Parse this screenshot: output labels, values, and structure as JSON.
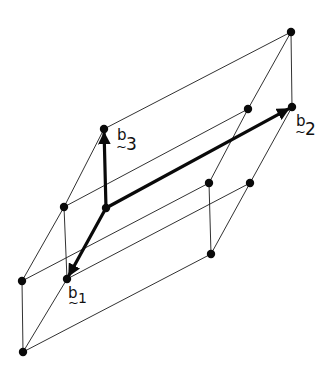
{
  "diagram": {
    "width": 336,
    "height": 367,
    "colors": {
      "line": "#1a1a1a",
      "vector": "#0a0a0a",
      "node": "#0a0a0a",
      "background": "#ffffff"
    },
    "nodes": [
      {
        "id": "O",
        "x": 106,
        "y": 208
      },
      {
        "id": "B1",
        "x": 67,
        "y": 279
      },
      {
        "id": "B2",
        "x": 292,
        "y": 107
      },
      {
        "id": "B3",
        "x": 104,
        "y": 129
      },
      {
        "id": "E",
        "x": 64,
        "y": 207
      },
      {
        "id": "F",
        "x": 22,
        "y": 281
      },
      {
        "id": "G",
        "x": 23,
        "y": 352
      },
      {
        "id": "H",
        "x": 291,
        "y": 32
      },
      {
        "id": "I",
        "x": 248,
        "y": 109
      },
      {
        "id": "J",
        "x": 209,
        "y": 183
      },
      {
        "id": "K",
        "x": 250,
        "y": 183
      },
      {
        "id": "L",
        "x": 211,
        "y": 254
      }
    ],
    "edges": [
      [
        "B3",
        "E"
      ],
      [
        "E",
        "F"
      ],
      [
        "E",
        "B1"
      ],
      [
        "F",
        "G"
      ],
      [
        "G",
        "B1"
      ],
      [
        "G",
        "L"
      ],
      [
        "F",
        "J"
      ],
      [
        "B1",
        "K"
      ],
      [
        "E",
        "I"
      ],
      [
        "B3",
        "H"
      ],
      [
        "J",
        "L"
      ],
      [
        "K",
        "L"
      ],
      [
        "J",
        "I"
      ],
      [
        "K",
        "B2"
      ],
      [
        "H",
        "I"
      ],
      [
        "H",
        "B2"
      ]
    ],
    "vectors": [
      {
        "name": "b1",
        "from": "O",
        "to": "B1",
        "label": "b",
        "subscript": "1",
        "tilde": "~"
      },
      {
        "name": "b2",
        "from": "O",
        "to": "B2",
        "label": "b",
        "subscript": "2",
        "tilde": "~"
      },
      {
        "name": "b3",
        "from": "O",
        "to": "B3",
        "label": "b",
        "subscript": "3",
        "tilde": "~"
      }
    ],
    "labels": {
      "b1": {
        "base": "b",
        "sub": "1",
        "tilde": "~"
      },
      "b2": {
        "base": "b",
        "sub": "2",
        "tilde": "~"
      },
      "b3": {
        "base": "b",
        "sub": "3",
        "tilde": "~"
      }
    }
  }
}
